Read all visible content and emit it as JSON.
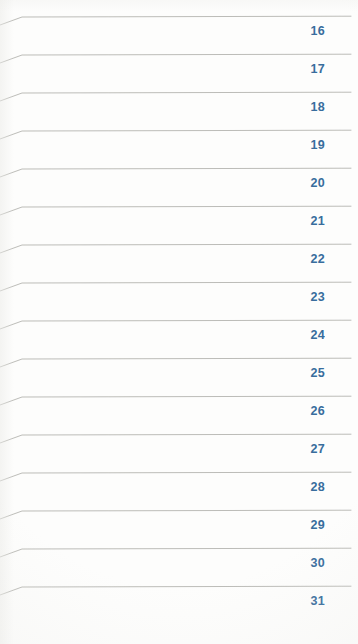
{
  "document": {
    "kind": "scanned-ruled-planner-page",
    "background_color": "#fdfdfc",
    "rule_line_color": "#b8b8b4",
    "day_number_color": "#2a6396",
    "first_line_y": 17,
    "row_pitch": 38,
    "rule_line_start_x": 0,
    "rule_line_bend_x": 22,
    "rule_line_end_x": 351,
    "rule_line_left_drop": 8
  },
  "rows": [
    {
      "day": "16"
    },
    {
      "day": "17"
    },
    {
      "day": "18"
    },
    {
      "day": "19"
    },
    {
      "day": "20"
    },
    {
      "day": "21"
    },
    {
      "day": "22"
    },
    {
      "day": "23"
    },
    {
      "day": "24"
    },
    {
      "day": "25"
    },
    {
      "day": "26"
    },
    {
      "day": "27"
    },
    {
      "day": "28"
    },
    {
      "day": "29"
    },
    {
      "day": "30"
    },
    {
      "day": "31"
    }
  ]
}
